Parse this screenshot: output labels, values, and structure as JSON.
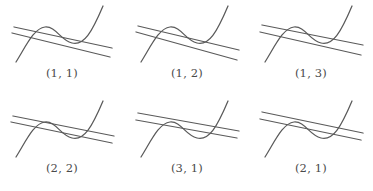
{
  "figure": {
    "type": "diagram-grid",
    "rows": 2,
    "columns": 3,
    "stroke_color": "#5a5a5a",
    "label_color": "#4a4a4a",
    "background_color": "#ffffff"
  },
  "panels": [
    {
      "label": "(1, 1)",
      "curve_name": "cubic-wave-curve",
      "lines": [
        {
          "name": "upper-secant-line",
          "x1": 14,
          "y1": 27,
          "x2": 112,
          "y2": 48
        },
        {
          "name": "lower-secant-line",
          "x1": 12,
          "y1": 33,
          "x2": 110,
          "y2": 57
        }
      ]
    },
    {
      "label": "(1, 2)",
      "curve_name": "cubic-wave-curve",
      "lines": [
        {
          "name": "upper-secant-line",
          "x1": 13,
          "y1": 26,
          "x2": 114,
          "y2": 50
        },
        {
          "name": "lower-secant-line",
          "x1": 11,
          "y1": 32,
          "x2": 112,
          "y2": 60
        }
      ]
    },
    {
      "label": "(1, 3)",
      "curve_name": "cubic-wave-curve",
      "lines": [
        {
          "name": "upper-secant-line",
          "x1": 13,
          "y1": 25,
          "x2": 114,
          "y2": 45
        },
        {
          "name": "lower-secant-line",
          "x1": 11,
          "y1": 32,
          "x2": 112,
          "y2": 55
        }
      ]
    },
    {
      "label": "(2, 2)",
      "curve_name": "cubic-wave-curve",
      "lines": [
        {
          "name": "upper-secant-line",
          "x1": 13,
          "y1": 21,
          "x2": 114,
          "y2": 41
        },
        {
          "name": "lower-secant-line",
          "x1": 11,
          "y1": 27,
          "x2": 112,
          "y2": 48
        }
      ]
    },
    {
      "label": "(3, 1)",
      "curve_name": "cubic-wave-curve",
      "lines": [
        {
          "name": "upper-secant-line",
          "x1": 13,
          "y1": 18,
          "x2": 114,
          "y2": 36
        },
        {
          "name": "lower-secant-line",
          "x1": 11,
          "y1": 25,
          "x2": 112,
          "y2": 43
        }
      ]
    },
    {
      "label": "(2, 1)",
      "curve_name": "cubic-wave-curve",
      "lines": [
        {
          "name": "upper-secant-line",
          "x1": 13,
          "y1": 17,
          "x2": 114,
          "y2": 38
        },
        {
          "name": "lower-secant-line",
          "x1": 11,
          "y1": 24,
          "x2": 112,
          "y2": 45
        }
      ]
    }
  ]
}
